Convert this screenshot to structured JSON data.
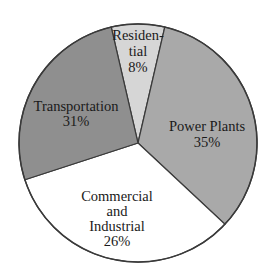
{
  "chart_data": {
    "type": "pie",
    "title": "",
    "slices": [
      {
        "label": "Residential",
        "label_lines": [
          "Residen-",
          "tial"
        ],
        "value": 8,
        "value_label": "8%",
        "color": "#d6d6d6",
        "start_deg": -13,
        "end_deg": 13
      },
      {
        "label": "Power Plants",
        "label_lines": [
          "Power Plants"
        ],
        "value": 35,
        "value_label": "35%",
        "color": "#a9a9a9",
        "start_deg": 13,
        "end_deg": 133
      },
      {
        "label": "Commercial and Industrial",
        "label_lines": [
          "Commercial",
          "and",
          "Industrial"
        ],
        "value": 26,
        "value_label": "26%",
        "color": "#ffffff",
        "start_deg": 133,
        "end_deg": 252
      },
      {
        "label": "Transportation",
        "label_lines": [
          "Transportation"
        ],
        "value": 31,
        "value_label": "31%",
        "color": "#8f8f8f",
        "start_deg": 252,
        "end_deg": 347
      }
    ],
    "categories": [
      "Residential",
      "Power Plants",
      "Commercial and Industrial",
      "Transportation"
    ],
    "values": [
      8,
      35,
      26,
      31
    ],
    "legend": "none (labels inside slices)",
    "grid": false
  },
  "labels": {
    "residential": {
      "l1": "Residen-",
      "l2": "tial",
      "pct": "8%"
    },
    "power": {
      "l1": "Power Plants",
      "pct": "35%"
    },
    "commercial": {
      "l1": "Commercial",
      "l2": "and",
      "l3": "Industrial",
      "pct": "26%"
    },
    "transport": {
      "l1": "Transportation",
      "pct": "31%"
    }
  }
}
